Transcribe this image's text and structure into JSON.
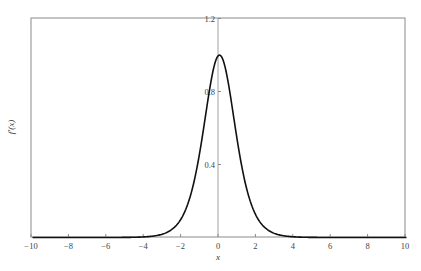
{
  "chart_data": {
    "type": "line",
    "title": "",
    "xlabel": "x",
    "ylabel": "f'(x)",
    "xlim": [
      -10,
      10
    ],
    "ylim": [
      0,
      1.25
    ],
    "x_ticks": [
      -10,
      -8,
      -6,
      -4,
      -2,
      0,
      2,
      4,
      6,
      8,
      10
    ],
    "x_tick_labels": [
      "−10",
      "−8",
      "−6",
      "−4",
      "−2",
      "0",
      "2",
      "4",
      "6",
      "8",
      "10"
    ],
    "y_ticks": [
      0.4,
      0.8,
      1.2
    ],
    "y_tick_labels": [
      "0.4",
      "0.8",
      "1.2"
    ],
    "grid": false,
    "legend": null,
    "series": [
      {
        "name": "f'(x)",
        "color": "#111111",
        "x": [
          -10,
          -6,
          -4,
          -3,
          -2.5,
          -2,
          -1.5,
          -1,
          -0.5,
          0,
          0.5,
          1,
          1.5,
          2,
          2.5,
          3,
          4,
          6,
          10
        ],
        "values": [
          0.0,
          0.0,
          0.004,
          0.02,
          0.05,
          0.11,
          0.24,
          0.47,
          0.81,
          1.0,
          0.81,
          0.47,
          0.24,
          0.11,
          0.05,
          0.02,
          0.004,
          0.0,
          0.0
        ]
      }
    ]
  }
}
